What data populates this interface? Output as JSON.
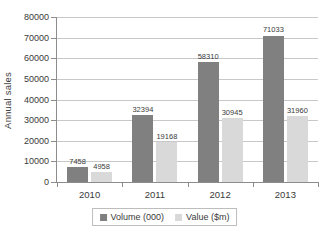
{
  "chart_data": {
    "type": "bar",
    "title": "",
    "xlabel": "",
    "ylabel": "Annual sales",
    "categories": [
      "2010",
      "2011",
      "2012",
      "2013"
    ],
    "series": [
      {
        "name": "Volume (000)",
        "color": "#808080",
        "values": [
          7458,
          32394,
          58310,
          71033
        ]
      },
      {
        "name": "Value ($m)",
        "color": "#d9d9d9",
        "values": [
          4958,
          19168,
          30945,
          31960
        ]
      }
    ],
    "ylim": [
      0,
      80000
    ],
    "ytick_step": 10000,
    "yticks": [
      0,
      10000,
      20000,
      30000,
      40000,
      50000,
      60000,
      70000,
      80000
    ],
    "ytick_labels": [
      "0",
      "10000",
      "20000",
      "30000",
      "40000",
      "50000",
      "60000",
      "70000",
      "80000"
    ],
    "data_labels": [
      [
        "7458",
        "4958"
      ],
      [
        "32394",
        "19168"
      ],
      [
        "58310",
        "30945"
      ],
      [
        "71033",
        "31960"
      ]
    ],
    "grid": "horizontal",
    "legend_position": "bottom"
  }
}
